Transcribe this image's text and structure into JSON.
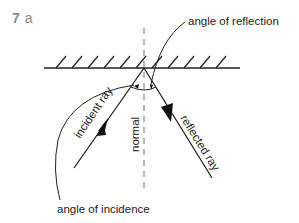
{
  "figure": {
    "number": "7",
    "part": "a"
  },
  "labels": {
    "angle_of_reflection": "angle of reflection",
    "angle_of_incidence": "angle of incidence",
    "incident_ray": "incident ray",
    "reflected_ray": "reflected ray",
    "normal": "normal"
  },
  "colors": {
    "line": "#222222",
    "figure_label": "#8a8a8a",
    "normal_dash": "#888888"
  }
}
